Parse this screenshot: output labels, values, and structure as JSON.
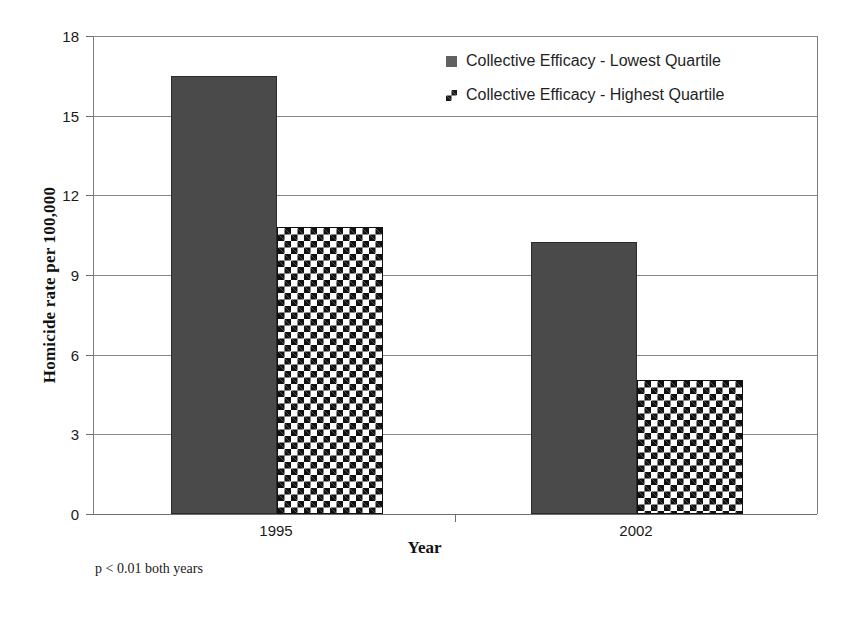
{
  "chart_data": {
    "type": "bar",
    "title": "",
    "xlabel": "Year",
    "ylabel": "Homicide rate per 100,000",
    "categories": [
      "1995",
      "2002"
    ],
    "series": [
      {
        "name": "Collective Efficacy - Lowest Quartile",
        "swatch": "solid",
        "color": "#4a4a4a",
        "values": [
          16.5,
          10.25
        ]
      },
      {
        "name": "Collective Efficacy - Highest Quartile",
        "swatch": "checker",
        "color": "#111111",
        "values": [
          10.8,
          5.05
        ]
      }
    ],
    "ylim": [
      0,
      18
    ],
    "yticks": [
      0,
      3,
      6,
      9,
      12,
      15,
      18
    ],
    "ytick_labels": [
      "0",
      "3",
      "6",
      "9",
      "12",
      "15",
      "18"
    ],
    "grid": true,
    "legend_position": "top-right",
    "annotations": [
      {
        "name": "significance-note",
        "text": "p < 0.01 both years"
      }
    ]
  },
  "legend": {
    "entries": [
      {
        "label": "Collective Efficacy - Lowest Quartile",
        "swatch": "solid"
      },
      {
        "label": "Collective Efficacy - Highest Quartile",
        "swatch": "checker"
      }
    ]
  },
  "axes": {
    "y_title": "Homicide rate per 100,000",
    "x_title": "Year"
  },
  "footnote": "p < 0.01 both years"
}
